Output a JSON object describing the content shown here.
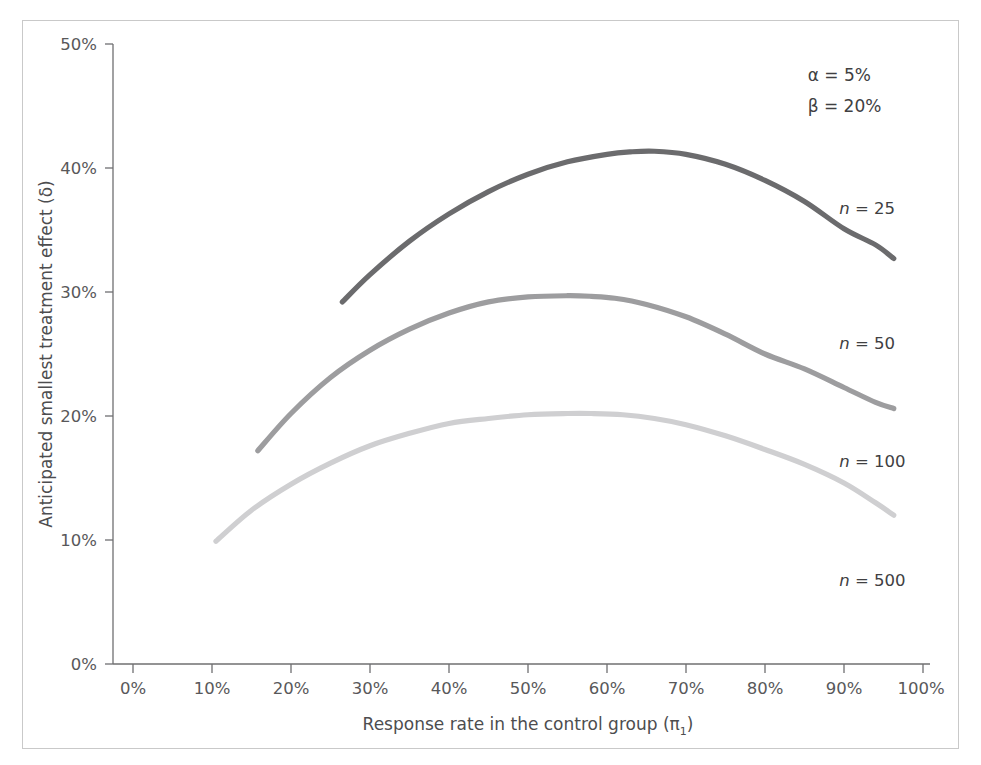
{
  "chart_data": {
    "type": "line",
    "title": "",
    "xlabel": "Response rate in the control group (π₁)",
    "ylabel": "Anticipated smallest treatment effect (δ)",
    "xlim": [
      0,
      100
    ],
    "ylim": [
      0,
      50
    ],
    "grid": false,
    "x_unit": "%",
    "y_unit": "%",
    "xticks": [
      "0%",
      "10%",
      "20%",
      "30%",
      "40%",
      "50%",
      "60%",
      "70%",
      "80%",
      "90%",
      "100%"
    ],
    "xtick_values": [
      0,
      10,
      20,
      30,
      40,
      50,
      60,
      70,
      80,
      90,
      100
    ],
    "yticks": [
      "0%",
      "10%",
      "20%",
      "30%",
      "40%",
      "50%"
    ],
    "ytick_values": [
      0,
      10,
      20,
      30,
      40,
      50
    ],
    "legend_position": "right-inline-labels",
    "annotations": [
      {
        "name": "alpha",
        "text": "α = 5%",
        "x": 93,
        "y": 47.5
      },
      {
        "name": "beta",
        "text": "β = 20%",
        "x": 93,
        "y": 45.0
      }
    ],
    "series": [
      {
        "name": "n = 25",
        "color": "#6b6b6d",
        "width": 5.2,
        "label_x": 97,
        "label_y": 36.8,
        "x": [
          26.5,
          30,
          35,
          40,
          45,
          50,
          55,
          60,
          63,
          66,
          70,
          75,
          80,
          85,
          90,
          94,
          96.3
        ],
        "y": [
          29.2,
          31.4,
          34.1,
          36.3,
          38.1,
          39.5,
          40.5,
          41.1,
          41.3,
          41.35,
          41.1,
          40.3,
          39.0,
          37.3,
          35.1,
          33.8,
          32.7
        ]
      },
      {
        "name": "n = 50",
        "color": "#9d9d9f",
        "width": 5.2,
        "label_x": 97,
        "label_y": 25.9,
        "x": [
          15.8,
          20,
          25,
          30,
          35,
          40,
          45,
          50,
          55,
          58,
          61,
          65,
          70,
          75,
          80,
          85,
          90,
          94,
          96.3
        ],
        "y": [
          17.2,
          20.2,
          23.1,
          25.3,
          27.0,
          28.3,
          29.2,
          29.6,
          29.7,
          29.65,
          29.5,
          29.0,
          28.0,
          26.6,
          25.0,
          23.8,
          22.3,
          21.1,
          20.6
        ]
      },
      {
        "name": "n = 100",
        "color": "#cfcfd1",
        "width": 5.2,
        "label_x": 97,
        "label_y": 16.4,
        "x": [
          10.5,
          15,
          20,
          25,
          30,
          35,
          40,
          45,
          50,
          55,
          58,
          62,
          66,
          70,
          75,
          80,
          85,
          90,
          94,
          96.3
        ],
        "y": [
          9.9,
          12.4,
          14.5,
          16.2,
          17.6,
          18.6,
          19.4,
          19.8,
          20.1,
          20.2,
          20.2,
          20.1,
          19.8,
          19.3,
          18.4,
          17.3,
          16.1,
          14.6,
          13.0,
          12.0
        ]
      },
      {
        "name": "n = 500",
        "color": "#e8e8ea",
        "width": 5.2,
        "label_x": 97,
        "label_y": 6.8,
        "x": [],
        "y": []
      }
    ]
  },
  "axes": {
    "y_title": "Anticipated smallest treatment effect (δ)",
    "x_title_main": "Response rate in the control group (",
    "x_title_pi": "π",
    "x_title_sub": "1",
    "x_title_close": ")"
  },
  "labels": {
    "alpha": "α = 5%",
    "beta": "β = 20%",
    "n25": "n = 25",
    "n50": "n = 50",
    "n100": "n = 100",
    "n500": "n = 500"
  },
  "ticks": {
    "y": [
      "50%",
      "40%",
      "30%",
      "20%",
      "10%",
      "0%"
    ],
    "x": [
      "0%",
      "10%",
      "20%",
      "30%",
      "40%",
      "50%",
      "60%",
      "70%",
      "80%",
      "90%",
      "100%"
    ]
  },
  "colors": {
    "frame": "#c9c9c9",
    "axis": "#6f6f71",
    "text": "#4d4d4f",
    "n25": "#6b6b6d",
    "n50": "#9d9d9f",
    "n100": "#cfcfd1",
    "n500": "#e8e8ea"
  }
}
